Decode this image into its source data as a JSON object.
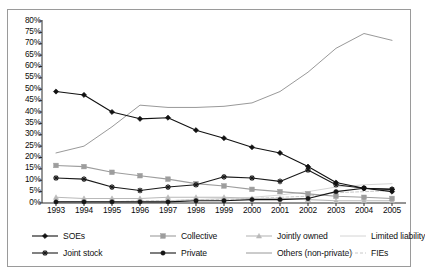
{
  "chart_data": {
    "type": "line",
    "title": "",
    "subtitle": "",
    "xlabel": "",
    "ylabel": "",
    "grid": false,
    "legend_position": "bottom",
    "categories": [
      "1993",
      "1994",
      "1995",
      "1996",
      "1997",
      "1998",
      "1999",
      "2000",
      "2001",
      "2002",
      "2003",
      "2004",
      "2005"
    ],
    "x": [
      1993,
      1994,
      1995,
      1996,
      1997,
      1998,
      1999,
      2000,
      2001,
      2002,
      2003,
      2004,
      2005
    ],
    "ylim": [
      0,
      80
    ],
    "ytick_values": [
      0,
      5,
      10,
      15,
      20,
      25,
      30,
      35,
      40,
      45,
      50,
      55,
      60,
      65,
      70,
      75,
      80
    ],
    "ytick_labels": [
      "0%",
      "5%",
      "10%",
      "15%",
      "20%",
      "25%",
      "30%",
      "35%",
      "40%",
      "45%",
      "50%",
      "55%",
      "60%",
      "65%",
      "70%",
      "75%",
      "80%"
    ],
    "value_unit": "%",
    "series": [
      {
        "name": "SOEs",
        "color": "#111111",
        "marker": "diamond",
        "dash": "none",
        "values": [
          49,
          47.5,
          40,
          37,
          37.5,
          32,
          28.5,
          24.5,
          22,
          16,
          9,
          6.5,
          5
        ]
      },
      {
        "name": "Collective",
        "color": "#9d9d9d",
        "marker": "square",
        "dash": "none",
        "values": [
          16.5,
          16,
          13.5,
          12,
          10.5,
          8.5,
          7.5,
          6,
          5,
          4,
          3,
          2.5,
          2
        ]
      },
      {
        "name": "Jointly owned",
        "color": "#b9b9b9",
        "marker": "triangle",
        "dash": "none",
        "values": [
          2.5,
          2,
          2,
          2,
          2.5,
          2.5,
          2.5,
          2,
          2,
          1.5,
          1,
          1,
          1
        ]
      },
      {
        "name": "Limited liability",
        "color": "#cfcfcf",
        "marker": "none",
        "dash": "none",
        "values": [
          0.5,
          0.5,
          0.5,
          0.5,
          1,
          1.5,
          2,
          2.5,
          3.5,
          5,
          7,
          8,
          8.5
        ]
      },
      {
        "name": "Joint stock",
        "color": "#1a1a1a",
        "marker": "cross",
        "dash": "none",
        "values": [
          11,
          10.5,
          7,
          5.5,
          7,
          8,
          11.5,
          11,
          9.5,
          14.5,
          8,
          6.5,
          6
        ]
      },
      {
        "name": "Private",
        "color": "#151515",
        "marker": "circle",
        "dash": "none",
        "values": [
          0.5,
          0.5,
          0.5,
          0.5,
          0.5,
          1,
          1,
          1.5,
          1.5,
          2,
          5,
          6.5,
          6
        ]
      },
      {
        "name": "Others (non-private)",
        "color": "#8d8d8d",
        "marker": "none",
        "dash": "none",
        "values": [
          22,
          25,
          33.5,
          43,
          42,
          42,
          42.5,
          44,
          49,
          57.5,
          68,
          74.5,
          71.5
        ]
      },
      {
        "name": "FIEs",
        "color": "#c2c2c2",
        "marker": "none",
        "dash": "dashed",
        "values": [
          0.5,
          0.5,
          0.5,
          1,
          1,
          1.5,
          1.5,
          2,
          2.5,
          3,
          4.5,
          5,
          5.5
        ]
      }
    ]
  },
  "legend": {
    "rows": [
      [
        {
          "label": "SOEs",
          "series": 0
        },
        {
          "label": "Collective",
          "series": 1
        },
        {
          "label": "Jointly owned",
          "series": 2
        },
        {
          "label": "Limited liability",
          "series": 3
        }
      ],
      [
        {
          "label": "Joint stock",
          "series": 4
        },
        {
          "label": "Private",
          "series": 5
        },
        {
          "label": "Others (non-private)",
          "series": 6
        },
        {
          "label": "FIEs",
          "series": 7
        }
      ]
    ]
  }
}
